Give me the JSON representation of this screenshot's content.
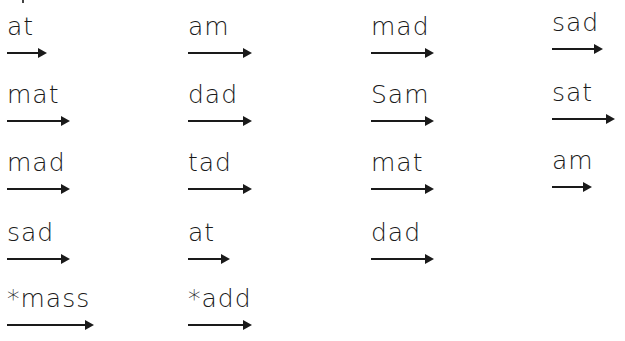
{
  "worksheet": {
    "columns": [
      {
        "items": [
          {
            "word": "at",
            "x": 7,
            "y": 14,
            "arrow_len": 45
          },
          {
            "word": "mat",
            "x": 7,
            "y": 82,
            "arrow_len": 68
          },
          {
            "word": "mad",
            "x": 7,
            "y": 150,
            "arrow_len": 68
          },
          {
            "word": "sad",
            "x": 7,
            "y": 220,
            "arrow_len": 68
          },
          {
            "word": "*mass",
            "x": 7,
            "y": 286,
            "arrow_len": 92
          }
        ]
      },
      {
        "items": [
          {
            "word": "am",
            "x": 188,
            "y": 14,
            "arrow_len": 69
          },
          {
            "word": "dad",
            "x": 188,
            "y": 82,
            "arrow_len": 69
          },
          {
            "word": "tad",
            "x": 188,
            "y": 150,
            "arrow_len": 69
          },
          {
            "word": "at",
            "x": 188,
            "y": 220,
            "arrow_len": 47
          },
          {
            "word": "*add",
            "x": 188,
            "y": 286,
            "arrow_len": 69
          }
        ]
      },
      {
        "items": [
          {
            "word": "mad",
            "x": 371,
            "y": 14,
            "arrow_len": 68
          },
          {
            "word": "Sam",
            "x": 371,
            "y": 82,
            "arrow_len": 68
          },
          {
            "word": "mat",
            "x": 371,
            "y": 150,
            "arrow_len": 68
          },
          {
            "word": "dad",
            "x": 371,
            "y": 220,
            "arrow_len": 68
          }
        ]
      },
      {
        "items": [
          {
            "word": "sad",
            "x": 552,
            "y": 10,
            "arrow_len": 56
          },
          {
            "word": "sat",
            "x": 552,
            "y": 80,
            "arrow_len": 68
          },
          {
            "word": "am",
            "x": 552,
            "y": 148,
            "arrow_len": 45
          }
        ]
      }
    ]
  }
}
